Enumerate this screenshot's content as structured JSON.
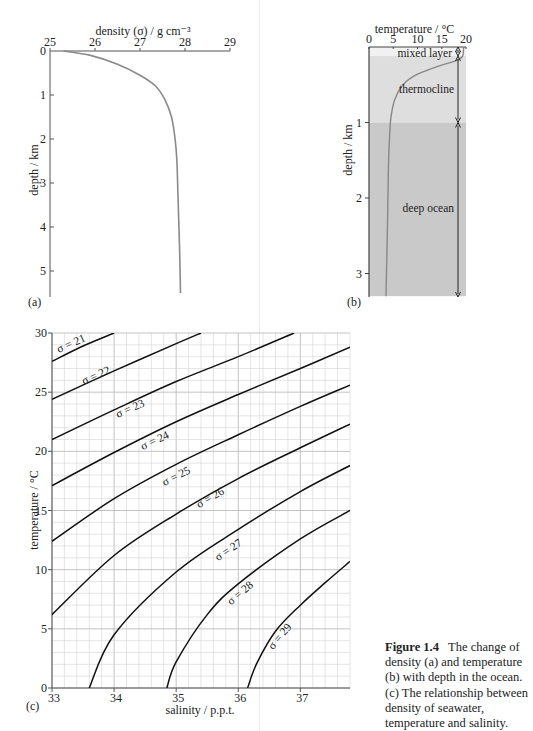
{
  "top_text_fragment": "… by depth …",
  "chart_data": [
    {
      "id": "a",
      "type": "line",
      "panel_label": "(a)",
      "title": "",
      "xlabel": "density (σ) / g cm⁻³",
      "ylabel": "depth / km",
      "x_ticks": [
        "25",
        "26",
        "27",
        "28",
        "29"
      ],
      "y_ticks": [
        "0",
        "1",
        "2",
        "3",
        "4",
        "5"
      ],
      "xlim": [
        25,
        29
      ],
      "ylim": [
        0,
        5.5
      ],
      "x_axis_position": "top",
      "y_inverted": true,
      "grid": false,
      "series": [
        {
          "name": "density profile",
          "x": [
            25.3,
            25.9,
            26.5,
            27.0,
            27.35,
            27.55,
            27.7,
            27.78,
            27.82,
            27.85,
            27.88,
            27.9
          ],
          "y": [
            0.0,
            0.1,
            0.3,
            0.55,
            0.8,
            1.1,
            1.5,
            2.0,
            2.5,
            3.5,
            4.5,
            5.5
          ]
        }
      ]
    },
    {
      "id": "b",
      "type": "line",
      "panel_label": "(b)",
      "xlabel": "temperature / °C",
      "ylabel": "depth / km",
      "x_ticks": [
        "0",
        "5",
        "10",
        "15",
        "20"
      ],
      "y_ticks": [
        "1",
        "2",
        "3"
      ],
      "xlim": [
        0,
        20
      ],
      "ylim": [
        0,
        3.3
      ],
      "x_axis_position": "top",
      "y_inverted": true,
      "grid": false,
      "zones": [
        {
          "label": "mixed layer",
          "from": 0.0,
          "to": 0.12,
          "color": "#f1f1f1"
        },
        {
          "label": "thermocline",
          "from": 0.12,
          "to": 1.0,
          "color": "#dedede"
        },
        {
          "label": "deep ocean",
          "from": 1.0,
          "to": 3.3,
          "color": "#c9c9c9"
        }
      ],
      "series": [
        {
          "name": "temperature profile",
          "x": [
            19.5,
            19.3,
            18.0,
            14.5,
            10.0,
            7.0,
            5.3,
            4.6,
            4.3,
            4.0,
            3.8,
            3.5
          ],
          "y": [
            0.0,
            0.12,
            0.18,
            0.25,
            0.36,
            0.5,
            0.7,
            0.9,
            1.1,
            1.6,
            2.4,
            3.3
          ]
        }
      ]
    },
    {
      "id": "c",
      "type": "line",
      "panel_label": "(c)",
      "xlabel": "salinity / p.p.t.",
      "ylabel": "temperature / °C",
      "x_ticks": [
        "33",
        "34",
        "35",
        "36",
        "37"
      ],
      "y_ticks": [
        "0",
        "5",
        "10",
        "15",
        "20",
        "25",
        "30"
      ],
      "xlim": [
        33,
        37.8
      ],
      "ylim": [
        0,
        30
      ],
      "grid": true,
      "grid_minor_x": 0.2,
      "grid_minor_y": 1,
      "series": [
        {
          "name": "σ = 21",
          "label": "σ = 21",
          "x": [
            33.0,
            33.5,
            34.0
          ],
          "y": [
            27.6,
            28.9,
            30.0
          ]
        },
        {
          "name": "σ = 22",
          "label": "σ = 22",
          "x": [
            33.0,
            34.0,
            35.0,
            35.4
          ],
          "y": [
            24.4,
            26.8,
            29.1,
            30.0
          ]
        },
        {
          "name": "σ = 23",
          "label": "σ = 23",
          "x": [
            33.0,
            34.0,
            35.0,
            36.0,
            36.9
          ],
          "y": [
            21.0,
            23.5,
            25.9,
            28.0,
            30.0
          ]
        },
        {
          "name": "σ = 24",
          "label": "σ = 24",
          "x": [
            33.0,
            34.0,
            35.0,
            36.0,
            37.0,
            37.8
          ],
          "y": [
            17.1,
            19.9,
            22.5,
            24.8,
            27.0,
            28.8
          ]
        },
        {
          "name": "σ = 25",
          "label": "σ = 25",
          "x": [
            33.0,
            34.0,
            35.0,
            36.0,
            37.0,
            37.8
          ],
          "y": [
            12.4,
            16.0,
            18.9,
            21.4,
            23.8,
            25.6
          ]
        },
        {
          "name": "σ = 26",
          "label": "σ = 26",
          "x": [
            33.0,
            34.0,
            35.0,
            36.0,
            37.0,
            37.8
          ],
          "y": [
            6.2,
            11.2,
            14.7,
            17.7,
            20.3,
            22.3
          ]
        },
        {
          "name": "σ = 27",
          "label": "σ = 27",
          "x": [
            33.6,
            34.0,
            35.0,
            36.0,
            37.0,
            37.8
          ],
          "y": [
            0.0,
            4.5,
            9.8,
            13.4,
            16.6,
            18.8
          ]
        },
        {
          "name": "σ = 28",
          "label": "σ = 28",
          "x": [
            34.85,
            35.0,
            35.5,
            36.0,
            37.0,
            37.8
          ],
          "y": [
            0.0,
            2.2,
            6.2,
            8.8,
            12.6,
            15.0
          ]
        },
        {
          "name": "σ = 29",
          "label": "σ = 29",
          "x": [
            36.15,
            36.3,
            36.6,
            37.0,
            37.4,
            37.8
          ],
          "y": [
            0.0,
            2.1,
            4.8,
            7.0,
            8.9,
            10.7
          ]
        }
      ]
    }
  ],
  "caption": {
    "figure_label": "Figure 1.4",
    "text": "The change of density (a) and temperature (b) with depth in the ocean. (c) The relationship between density of seawater, temperature and salinity."
  }
}
